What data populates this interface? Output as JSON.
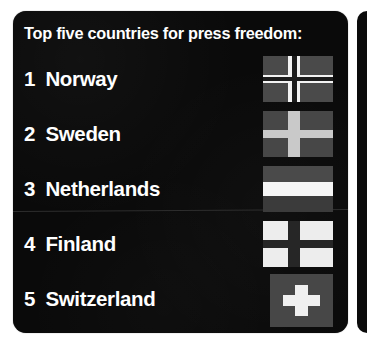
{
  "card": {
    "header": "Top five countries for press freedom:",
    "background_color": "#0a0a0a",
    "text_color": "#ffffff",
    "divider_color": "#2e2e2e",
    "divider_after_rank": 3
  },
  "rows": [
    {
      "rank": "1",
      "country": "Norway",
      "flag": {
        "name": "norway-flag",
        "type": "nordic-cross-double",
        "field_color": "#4a4a4a",
        "cross_color": "#f2f2f2",
        "inner_cross_color": "#1c1c1c"
      }
    },
    {
      "rank": "2",
      "country": "Sweden",
      "flag": {
        "name": "sweden-flag",
        "type": "nordic-cross",
        "field_color": "#474747",
        "cross_color": "#c9c9c9",
        "inner_cross_color": ""
      }
    },
    {
      "rank": "3",
      "country": "Netherlands",
      "flag": {
        "name": "netherlands-flag",
        "type": "horizontal-triband",
        "band_top_color": "#4a4a4a",
        "band_middle_color": "#f6f6f6",
        "band_bottom_color": "#3b3b3b"
      }
    },
    {
      "rank": "4",
      "country": "Finland",
      "flag": {
        "name": "finland-flag",
        "type": "nordic-cross",
        "field_color": "#ededed",
        "cross_color": "#262626",
        "inner_cross_color": ""
      }
    },
    {
      "rank": "5",
      "country": "Switzerland",
      "flag": {
        "name": "switzerland-flag",
        "type": "greek-cross",
        "field_color": "#474747",
        "cross_color": "#f0f0f0"
      }
    }
  ]
}
